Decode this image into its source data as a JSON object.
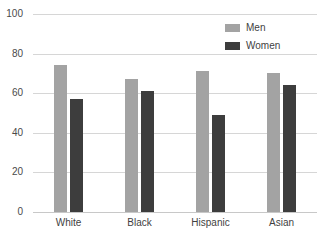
{
  "chart_data": {
    "type": "bar",
    "title": "",
    "subtitle": "",
    "xlabel": "",
    "ylabel": "",
    "ylim": [
      0,
      100
    ],
    "ytick_labels": [
      "100",
      "80",
      "60",
      "40",
      "20",
      "0"
    ],
    "ytick_values": [
      100,
      80,
      60,
      40,
      20,
      0
    ],
    "grid": true,
    "legend_position": "top-right",
    "categories": [
      "White",
      "Black",
      "Hispanic",
      "Asian"
    ],
    "series": [
      {
        "name": "Men",
        "color": "#a3a3a3",
        "values": [
          74,
          67,
          71,
          70
        ]
      },
      {
        "name": "Women",
        "color": "#3d3d3d",
        "values": [
          57,
          61,
          49,
          64
        ]
      }
    ]
  },
  "legend": {
    "items": [
      {
        "label": "Men"
      },
      {
        "label": "Women"
      }
    ]
  }
}
